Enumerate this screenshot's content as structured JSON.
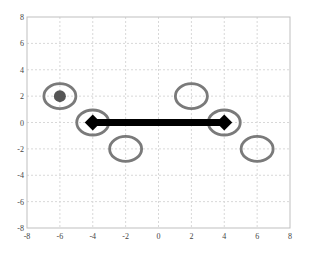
{
  "chart_data": {
    "type": "scatter",
    "title": "",
    "xlabel": "",
    "ylabel": "",
    "xlim": [
      -8,
      8
    ],
    "ylim": [
      -8,
      8
    ],
    "grid": true,
    "x_ticks": [
      -8,
      -6,
      -4,
      -2,
      0,
      2,
      4,
      6,
      8
    ],
    "y_ticks": [
      8,
      6,
      4,
      2,
      0,
      -2,
      -4,
      -6,
      -8
    ],
    "rings": [
      {
        "x": -6,
        "y": 2
      },
      {
        "x": -4,
        "y": 0
      },
      {
        "x": -2,
        "y": -2
      },
      {
        "x": 2,
        "y": 2
      },
      {
        "x": 4,
        "y": 0
      },
      {
        "x": 6,
        "y": -2
      }
    ],
    "filled_points": [
      {
        "x": -6,
        "y": 2
      }
    ],
    "segment": {
      "start": {
        "x": -4,
        "y": 0
      },
      "end": {
        "x": 4,
        "y": 0
      },
      "marker": "diamond"
    },
    "colors": {
      "ring": "#7a7a7a",
      "filled_point": "#555555",
      "segment": "#000000",
      "grid": "#d8d8d8",
      "axis": "#bfbfbf"
    }
  }
}
